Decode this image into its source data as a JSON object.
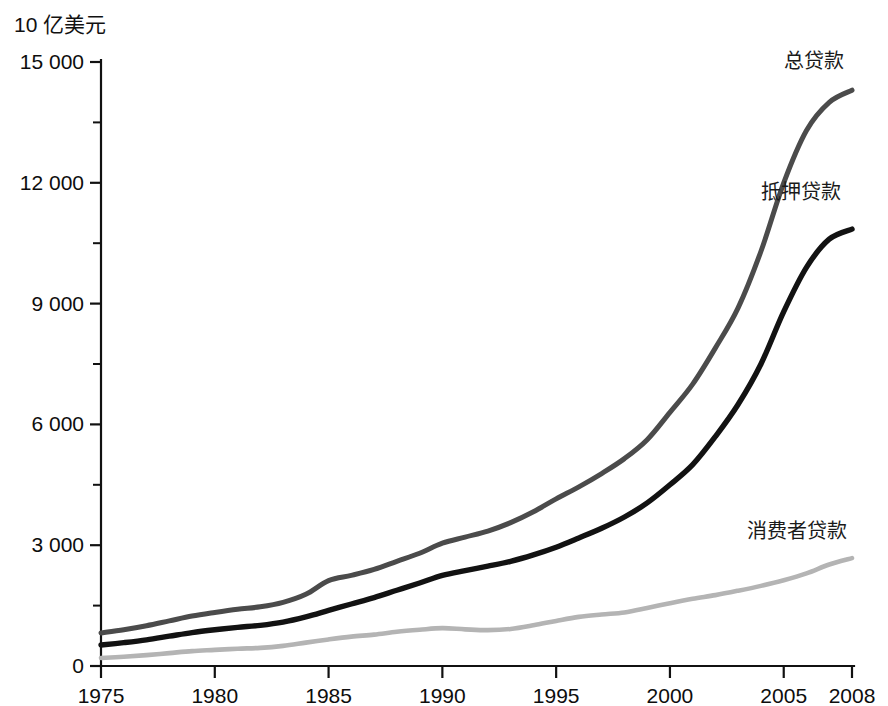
{
  "chart_data": {
    "type": "line",
    "title": "",
    "subtitle": "",
    "xlabel": "",
    "ylabel": "10 亿美元",
    "xlim": [
      1975,
      2008
    ],
    "ylim": [
      0,
      15000
    ],
    "grid": false,
    "legend_position": "inline-right",
    "x_ticks": [
      "1975",
      "1980",
      "1985",
      "1990",
      "1995",
      "2000",
      "2005",
      "2008"
    ],
    "x_tick_values": [
      1975,
      1980,
      1985,
      1990,
      1995,
      2000,
      2005,
      2008
    ],
    "x_minor_tick_values": [
      1977.5,
      1982.5,
      1987.5,
      1992.5,
      1997.5,
      2002.5
    ],
    "y_ticks": [
      "0",
      "3 000",
      "6 000",
      "9 000",
      "12 000",
      "15 000"
    ],
    "y_tick_values": [
      0,
      3000,
      6000,
      9000,
      12000,
      15000
    ],
    "y_minor_tick_values": [
      1500,
      4500,
      7500,
      10500,
      13500
    ],
    "x": [
      1975,
      1976,
      1977,
      1978,
      1979,
      1980,
      1981,
      1982,
      1983,
      1984,
      1985,
      1986,
      1987,
      1988,
      1989,
      1990,
      1991,
      1992,
      1993,
      1994,
      1995,
      1996,
      1997,
      1998,
      1999,
      2000,
      2001,
      2002,
      2003,
      2004,
      2005,
      2006,
      2007,
      2008
    ],
    "series": [
      {
        "name": "总贷款",
        "color": "#4b4b4b",
        "label_x": 2005.0,
        "label_y": 14850,
        "values": [
          820,
          900,
          1000,
          1120,
          1240,
          1330,
          1410,
          1470,
          1580,
          1780,
          2120,
          2250,
          2400,
          2600,
          2800,
          3050,
          3200,
          3350,
          3560,
          3830,
          4150,
          4450,
          4780,
          5150,
          5620,
          6300,
          7000,
          7900,
          8900,
          10300,
          12000,
          13300,
          14000,
          14300
        ]
      },
      {
        "name": "抵押贷款",
        "color": "#121212",
        "label_x": 2004.0,
        "label_y": 11600,
        "values": [
          520,
          580,
          650,
          740,
          830,
          900,
          960,
          1010,
          1090,
          1220,
          1380,
          1540,
          1700,
          1880,
          2060,
          2250,
          2370,
          2480,
          2600,
          2760,
          2950,
          3180,
          3420,
          3700,
          4050,
          4500,
          5000,
          5700,
          6500,
          7500,
          8800,
          9900,
          10600,
          10850
        ]
      },
      {
        "name": "消费者贷款",
        "color": "#b4b4b4",
        "label_x": 2003.4,
        "label_y": 3180,
        "values": [
          200,
          230,
          270,
          320,
          370,
          400,
          430,
          450,
          500,
          580,
          660,
          730,
          780,
          850,
          900,
          940,
          910,
          890,
          920,
          1010,
          1120,
          1220,
          1280,
          1330,
          1440,
          1560,
          1670,
          1760,
          1870,
          1990,
          2130,
          2300,
          2520,
          2680
        ]
      }
    ]
  }
}
